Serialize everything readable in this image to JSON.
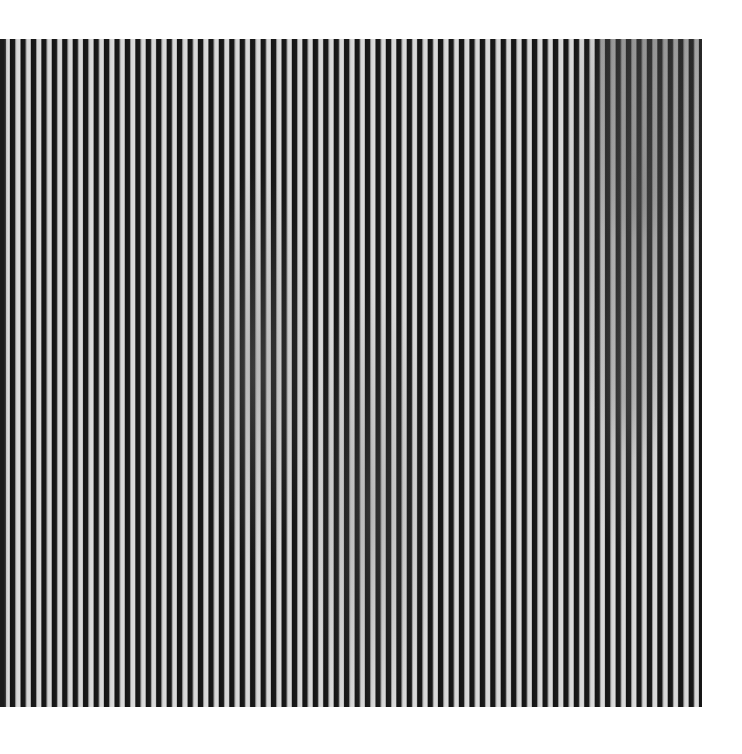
{
  "image": {
    "subject": "Op-art painting of dense vertical black and white stripes",
    "background_color": "#ffffff",
    "stripe_dark_color": "#141414",
    "stripe_light_color": "#dcdcdc",
    "stripe_period_px": 10.44,
    "painting_bounds": {
      "left": 0,
      "top": 39,
      "right": 702,
      "bottom": 707
    }
  }
}
